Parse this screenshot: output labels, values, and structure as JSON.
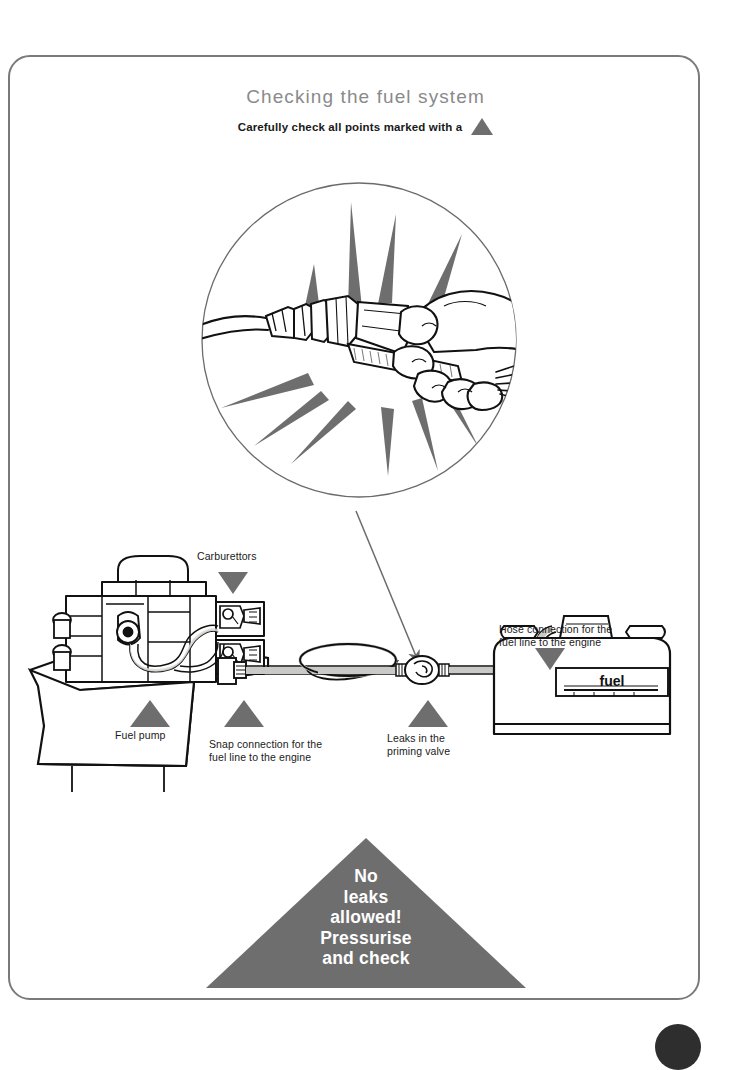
{
  "page": {
    "title": "Checking the fuel system",
    "subtitle": "Carefully check all points marked with a",
    "marker_icon": "triangle-up-icon",
    "frame_color": "#7a7a7a",
    "accent_color": "#6e6e6e",
    "title_color": "#8a8a8a"
  },
  "inset": {
    "name": "snap-connection-closeup",
    "description": "Hand gripping the fuel line snap connector with starburst rays"
  },
  "callout_arrow": {
    "from": "inset",
    "to": "priming-valve"
  },
  "labels": [
    {
      "id": "carburettors",
      "text": "Carburettors",
      "marker": "triangle-down-icon"
    },
    {
      "id": "fuel-pump",
      "text": "Fuel pump",
      "marker": "triangle-up-icon"
    },
    {
      "id": "snap-connection",
      "text": "Snap connection for the\nfuel line to the engine",
      "marker": "triangle-up-icon"
    },
    {
      "id": "priming-valve",
      "text": "Leaks in the\npriming valve",
      "marker": "triangle-up-icon"
    },
    {
      "id": "hose-connection",
      "text": "Hose connection for the\nfuel line to the engine",
      "marker": "triangle-down-icon"
    }
  ],
  "fuel_tank": {
    "gauge_label": "fuel"
  },
  "warning": {
    "text": "No\nleaks\nallowed!\nPressurise\nand check",
    "shape": "triangle-up"
  }
}
